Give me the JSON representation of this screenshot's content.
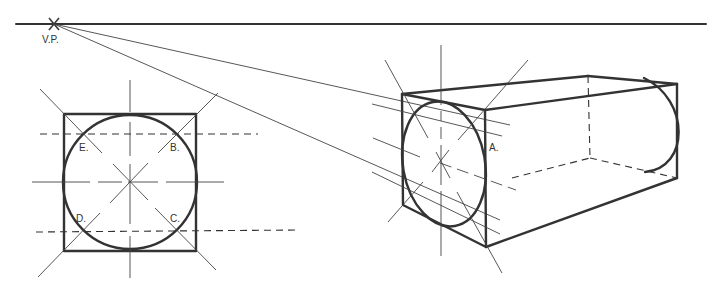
{
  "diagram": {
    "horizon": {
      "label": "V.P.",
      "vp": [
        54,
        24
      ]
    },
    "square_view": {
      "labels": {
        "e": "E.",
        "b": "B.",
        "d": "D.",
        "c": "C."
      }
    },
    "perspective_view": {
      "labels": {
        "a": "A."
      }
    },
    "colors": {
      "line": "#333333",
      "background": "#ffffff"
    }
  }
}
